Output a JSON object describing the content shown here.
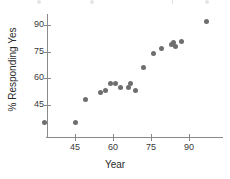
{
  "chart_data": {
    "type": "scatter",
    "title": "",
    "xlabel": "Year",
    "ylabel": "% Responding Yes",
    "xlim": [
      30,
      100
    ],
    "ylim": [
      30,
      95
    ],
    "xticks": [
      45,
      60,
      75,
      90
    ],
    "yticks": [
      45,
      60,
      75,
      90
    ],
    "grid": false,
    "legend": null,
    "marker_color": "#6e6e6e",
    "axis_color": "#8a8a8a",
    "points": [
      {
        "x": 33,
        "y": 35
      },
      {
        "x": 45,
        "y": 35
      },
      {
        "x": 49,
        "y": 48
      },
      {
        "x": 55,
        "y": 52
      },
      {
        "x": 57,
        "y": 53
      },
      {
        "x": 59,
        "y": 57
      },
      {
        "x": 61,
        "y": 57
      },
      {
        "x": 63,
        "y": 55
      },
      {
        "x": 66,
        "y": 55
      },
      {
        "x": 67,
        "y": 57
      },
      {
        "x": 69,
        "y": 53
      },
      {
        "x": 72,
        "y": 66
      },
      {
        "x": 76,
        "y": 74
      },
      {
        "x": 79,
        "y": 77
      },
      {
        "x": 83,
        "y": 79
      },
      {
        "x": 84,
        "y": 80
      },
      {
        "x": 84.5,
        "y": 78
      },
      {
        "x": 87,
        "y": 81
      },
      {
        "x": 97,
        "y": 92
      }
    ]
  },
  "axes": {
    "y_tick_labels": [
      "45",
      "60",
      "75",
      "90"
    ],
    "x_tick_labels": [
      "45",
      "60",
      "75",
      "90"
    ],
    "y_axis_title": "% Responding Yes",
    "x_axis_title": "Year"
  }
}
